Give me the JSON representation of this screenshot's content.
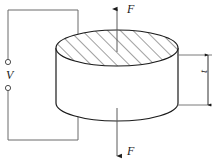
{
  "figure": {
    "labels": {
      "force_top": "F",
      "force_bottom": "F",
      "voltage": "V",
      "thickness": "t"
    },
    "icons": {
      "arrow_up": "arrow-up-icon",
      "arrow_down": "arrow-down-icon",
      "terminal": "terminal-circle-icon"
    },
    "colors": {
      "stroke": "#1a1a1a",
      "wire": "#6b6b6b",
      "hatch": "#2b2b2b",
      "background": "#ffffff",
      "face": "#ffffff"
    },
    "geometry": {
      "cylinder_center_x": 117,
      "cylinder_top_y": 48,
      "cylinder_bottom_y": 103,
      "cylinder_rx": 61,
      "cylinder_ry": 18,
      "force_line_x": 117,
      "force_top_start_y": 8,
      "force_bottom_end_y": 157,
      "wire_left_x": 8,
      "wire_right_x": 78,
      "wire_top_y": 10,
      "wire_bottom_y": 140,
      "terminal_top_y": 62,
      "terminal_bottom_y": 88,
      "terminal_radius": 2.6,
      "dim_line_x": 210,
      "dim_top_y": 55,
      "dim_bottom_y": 105,
      "ext_line_left_x": 178,
      "hatch_spacing": 9,
      "hatch_angle_deg": 45
    }
  }
}
